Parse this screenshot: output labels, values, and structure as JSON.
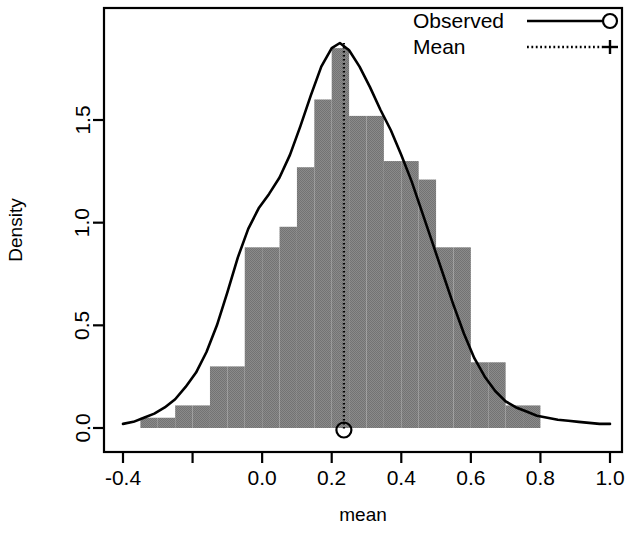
{
  "chart_data": {
    "type": "bar",
    "title": "",
    "subtitle": "",
    "xlabel": "mean",
    "ylabel": "Density",
    "xlim": [
      -0.4,
      1.0
    ],
    "ylim": [
      0.0,
      1.95
    ],
    "grid": false,
    "bar_color": "#808080",
    "line_color": "#000000",
    "legend_position": "top-right",
    "x_ticks": [
      -0.4,
      -0.2,
      0.0,
      0.2,
      0.4,
      0.6,
      0.8,
      1.0
    ],
    "x_tick_labels": [
      "-0.4",
      "",
      "0.0",
      "0.2",
      "0.4",
      "0.6",
      "0.8",
      "1.0"
    ],
    "y_ticks": [
      0.0,
      0.5,
      1.0,
      1.5
    ],
    "y_tick_labels": [
      "0.0",
      "0.5",
      "1.0",
      "1.5"
    ],
    "bin_width": 0.05,
    "bin_edges": [
      -0.35,
      -0.3,
      -0.25,
      -0.2,
      -0.15,
      -0.1,
      -0.05,
      0.0,
      0.05,
      0.1,
      0.15,
      0.2,
      0.25,
      0.3,
      0.35,
      0.4,
      0.45,
      0.5,
      0.55,
      0.6,
      0.65,
      0.7,
      0.75,
      0.8
    ],
    "bar_heights": [
      0.05,
      0.05,
      0.11,
      0.11,
      0.3,
      0.3,
      0.88,
      0.88,
      0.98,
      1.27,
      1.6,
      1.85,
      1.52,
      1.52,
      1.3,
      1.3,
      1.21,
      0.88,
      0.88,
      0.32,
      0.32,
      0.11,
      0.11
    ],
    "mean_value": 0.235,
    "mean_marker_y": 0.0,
    "density_curve": {
      "name": "Observed",
      "x": [
        -0.4,
        -0.37,
        -0.34,
        -0.31,
        -0.28,
        -0.25,
        -0.22,
        -0.19,
        -0.16,
        -0.13,
        -0.1,
        -0.07,
        -0.04,
        -0.01,
        0.02,
        0.05,
        0.08,
        0.11,
        0.14,
        0.17,
        0.2,
        0.2235,
        0.25,
        0.28,
        0.31,
        0.34,
        0.37,
        0.4,
        0.43,
        0.46,
        0.49,
        0.52,
        0.55,
        0.58,
        0.61,
        0.64,
        0.67,
        0.7,
        0.73,
        0.76,
        0.79,
        0.82,
        0.85,
        0.88,
        0.91,
        0.94,
        0.97,
        1.0
      ],
      "y": [
        0.02,
        0.03,
        0.05,
        0.07,
        0.1,
        0.14,
        0.2,
        0.27,
        0.37,
        0.5,
        0.66,
        0.83,
        0.97,
        1.07,
        1.14,
        1.22,
        1.33,
        1.47,
        1.62,
        1.76,
        1.85,
        1.875,
        1.84,
        1.76,
        1.66,
        1.55,
        1.45,
        1.33,
        1.2,
        1.05,
        0.9,
        0.75,
        0.6,
        0.46,
        0.34,
        0.25,
        0.18,
        0.13,
        0.1,
        0.08,
        0.06,
        0.05,
        0.04,
        0.035,
        0.03,
        0.025,
        0.02,
        0.02
      ]
    },
    "legend": [
      {
        "label": "Observed",
        "style": "solid",
        "marker": "circle"
      },
      {
        "label": "Mean",
        "style": "dotted",
        "marker": "plus"
      }
    ]
  },
  "axes": {
    "x_title": "mean",
    "y_title": "Density"
  },
  "legend": {
    "observed_label": "Observed",
    "mean_label": "Mean"
  },
  "ticks": {
    "x": [
      "-0.4",
      "",
      "0.0",
      "0.2",
      "0.4",
      "0.6",
      "0.8",
      "1.0"
    ],
    "y": [
      "0.0",
      "0.5",
      "1.0",
      "1.5"
    ]
  }
}
